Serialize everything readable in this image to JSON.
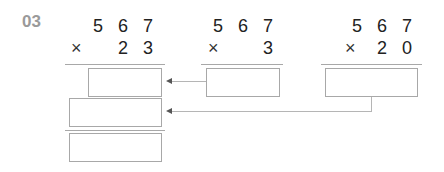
{
  "problem_number": "03",
  "problems": [
    {
      "multiplicand": "5 6 7",
      "operator": "×",
      "multiplier": "2 3"
    },
    {
      "multiplicand": "5 6 7",
      "operator": "×",
      "multiplier": "3"
    },
    {
      "multiplicand": "5 6 7",
      "operator": "×",
      "multiplier": "2 0"
    }
  ],
  "answer_boxes": [
    {
      "id": "partial-567x3",
      "value": ""
    },
    {
      "id": "partial-567x20",
      "value": ""
    },
    {
      "id": "final-567x23",
      "value": ""
    },
    {
      "id": "result-567x3",
      "value": ""
    },
    {
      "id": "result-567x20",
      "value": ""
    }
  ],
  "colors": {
    "label": "#9a9a9a",
    "digits": "#222222",
    "lines": "#a8a8a8",
    "arrow": "#555555"
  }
}
